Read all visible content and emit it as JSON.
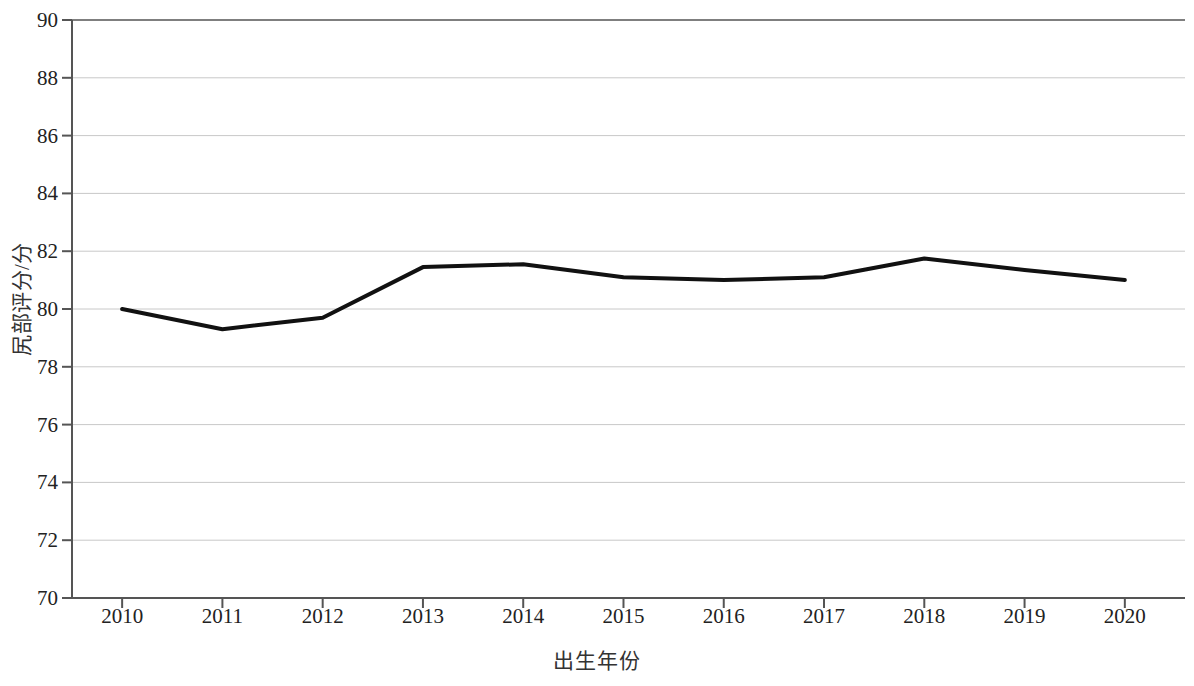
{
  "chart_data": {
    "type": "line",
    "title": "",
    "xlabel": "出生年份",
    "ylabel": "尻部评分/分",
    "categories": [
      "2010",
      "2011",
      "2012",
      "2013",
      "2014",
      "2015",
      "2016",
      "2017",
      "2018",
      "2019",
      "2020"
    ],
    "x": [
      2010,
      2011,
      2012,
      2013,
      2014,
      2015,
      2016,
      2017,
      2018,
      2019,
      2020
    ],
    "values": [
      80.0,
      79.3,
      79.7,
      81.45,
      81.55,
      81.1,
      81.0,
      81.1,
      81.75,
      81.35,
      81.0
    ],
    "series": [
      {
        "name": "尻部评分",
        "values": [
          80.0,
          79.3,
          79.7,
          81.45,
          81.55,
          81.1,
          81.0,
          81.1,
          81.75,
          81.35,
          81.0
        ],
        "color": "#111111"
      }
    ],
    "ylim": [
      70,
      90
    ],
    "ytick_labels": [
      "70",
      "72",
      "74",
      "76",
      "78",
      "80",
      "82",
      "84",
      "86",
      "88",
      "90"
    ],
    "yticks": [
      70,
      72,
      74,
      76,
      78,
      80,
      82,
      84,
      86,
      88,
      90
    ],
    "xlim": [
      2009.5,
      2020.6
    ],
    "grid": true,
    "grid_axis": "y",
    "grid_color": "#c8c8c8",
    "axis_color": "#555555",
    "legend": null,
    "legend_position": "none",
    "line_width": 4,
    "markers": false
  },
  "colors": {
    "background": "#ffffff",
    "line": "#111111",
    "grid": "#c8c8c8",
    "axis": "#555555",
    "text": "#222222"
  }
}
